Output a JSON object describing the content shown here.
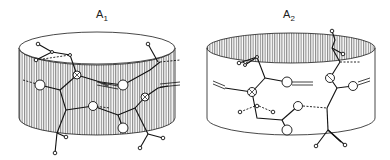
{
  "figure": {
    "panels": [
      {
        "id": "A1",
        "label_main": "A",
        "label_sub": "1",
        "shading": "side-wall hatched"
      },
      {
        "id": "A2",
        "label_main": "A",
        "label_sub": "2",
        "shading": "inner top rim hatched"
      }
    ]
  },
  "colors": {
    "line": "#1a1a1a",
    "background": "#ffffff"
  }
}
